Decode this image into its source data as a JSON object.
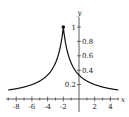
{
  "chart_data": {
    "type": "line",
    "title": "",
    "xlabel": "x",
    "ylabel": "y",
    "xlim": [
      -9,
      5
    ],
    "ylim": [
      0,
      1.1
    ],
    "x_ticks": [
      -8,
      -6,
      -4,
      -2,
      2,
      4
    ],
    "x_tick_labels": [
      "-8",
      "-6",
      "-4",
      "-2",
      "2",
      "4"
    ],
    "y_ticks": [
      0.2,
      0.4,
      0.6,
      0.8,
      1
    ],
    "y_tick_labels": [
      "0.2",
      "0.4",
      "0.6",
      "0.8",
      "1"
    ],
    "grid": false,
    "series": [
      {
        "name": "y = 1/(1+|x+2|)",
        "x": [
          -9,
          -8,
          -7,
          -6,
          -5,
          -4,
          -3,
          -2.5,
          -2,
          -1.5,
          -1,
          0,
          1,
          2,
          3,
          4,
          5
        ],
        "y": [
          0.125,
          0.143,
          0.167,
          0.2,
          0.25,
          0.333,
          0.5,
          0.667,
          1,
          0.667,
          0.5,
          0.333,
          0.25,
          0.2,
          0.167,
          0.143,
          0.125
        ]
      }
    ],
    "annotations": [
      {
        "type": "point",
        "x": -2,
        "y": 1,
        "style": "filled-dot"
      }
    ]
  }
}
